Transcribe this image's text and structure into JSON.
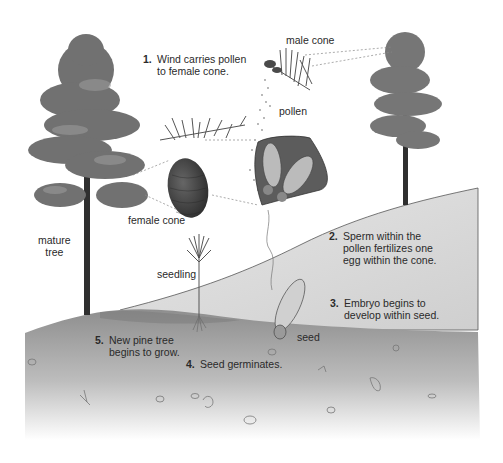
{
  "diagram": {
    "palette": {
      "background": "#ffffff",
      "hill_light": "#d9d9d9",
      "hill_dark": "#8f8f8f",
      "soil_top": "#9a9a9a",
      "soil_bottom": "#f4f4f4",
      "foliage": "#6f6f6f",
      "trunk": "#2f2f2f",
      "cone": "#3e3e3e",
      "text": "#2a2a2a"
    },
    "labels": {
      "male_cone": "male cone",
      "pollen": "pollen",
      "female_cone": "female cone",
      "mature_tree": "mature\ntree",
      "seedling": "seedling",
      "seed": "seed"
    },
    "steps": [
      {
        "num": "1.",
        "text": "Wind carries pollen\nto female cone."
      },
      {
        "num": "2.",
        "text": "Sperm within the\npollen fertilizes one\negg within the cone."
      },
      {
        "num": "3.",
        "text": "Embryo begins to\ndevelop within seed."
      },
      {
        "num": "4.",
        "text": "Seed germinates."
      },
      {
        "num": "5.",
        "text": "New pine tree\nbegins to grow."
      }
    ]
  }
}
